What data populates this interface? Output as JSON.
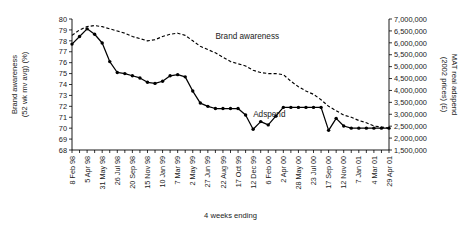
{
  "chart_data": {
    "type": "line",
    "title": "",
    "xlabel": "4 weeks ending",
    "ylabel": "Brand awareness (52 wk mv avg) (%)",
    "ylabel_line1": "Brand awareness",
    "ylabel_line2": "(52 wk mv avg) (%)",
    "y2label": "MAT real adspend (2002 prices) (£)",
    "y2label_line1": "MAT real adspend",
    "y2label_line2": "(2002 prices) (£)",
    "grid": false,
    "legend_position": "inline-annotations",
    "ylim": [
      68,
      80
    ],
    "yticks": [
      68,
      69,
      70,
      71,
      72,
      73,
      74,
      75,
      76,
      77,
      78,
      79,
      80
    ],
    "ytick_labels": [
      "68",
      "69",
      "70",
      "71",
      "72",
      "73",
      "74",
      "75",
      "76",
      "77",
      "78",
      "79",
      "80"
    ],
    "y2lim": [
      1500000,
      7000000
    ],
    "y2ticks": [
      1500000,
      2000000,
      2500000,
      3000000,
      3500000,
      4000000,
      4500000,
      5000000,
      5500000,
      6000000,
      6500000,
      7000000
    ],
    "y2tick_labels": [
      "1,500,000",
      "2,000,000",
      "2,500,000",
      "3,000,000",
      "3,500,000",
      "4,000,000",
      "4,500,000",
      "5,000,000",
      "5,500,000",
      "6,000,000",
      "6,500,000",
      "7,000,000"
    ],
    "categories": [
      "8 Feb 98",
      "8 Mar 98",
      "5 Apr 98",
      "3 May 98",
      "31 May 98",
      "28 Jun 98",
      "26 Jul 98",
      "23 Aug 98",
      "20 Sep 98",
      "18 Oct 98",
      "15 Nov 98",
      "13 Dec 98",
      "10 Jan 99",
      "7 Feb 99",
      "7 Mar 99",
      "4 Apr 99",
      "2 May 99",
      "30 May 99",
      "27 Jun 99",
      "25 Jul 99",
      "22 Aug 99",
      "19 Sep 99",
      "17 Oct 99",
      "14 Nov 99",
      "12 Dec 99",
      "9 Jan 00",
      "6 Feb 00",
      "5 Mar 00",
      "2 Apr 00",
      "30 Apr 00",
      "28 May 00",
      "25 Jun 00",
      "23 Jul 00",
      "20 Aug 00",
      "17 Sep 00",
      "15 Oct 00",
      "12 Nov 00",
      "10 Dec 00",
      "7 Jan 01",
      "4 Feb 01",
      "4 Mar 01",
      "1 Apr 01",
      "29 Apr 01"
    ],
    "xtick_labels": [
      "8 Feb 98",
      "5 Apr 98",
      "31 May 98",
      "26 Jul 98",
      "20 Sep 98",
      "15 Nov 98",
      "10 Jan 99",
      "7 Mar 99",
      "2 May 99",
      "27 Jun 99",
      "22 Aug 99",
      "17 Oct 99",
      "12 Dec 99",
      "6 Feb 00",
      "2 Apr 00",
      "28 May 00",
      "23 Jul 00",
      "17 Sep 00",
      "12 Nov 00",
      "7 Jan 01",
      "4 Mar 01",
      "29 Apr 01"
    ],
    "xtick_indices": [
      0,
      2,
      4,
      6,
      8,
      10,
      12,
      14,
      16,
      18,
      20,
      22,
      24,
      26,
      28,
      30,
      32,
      34,
      36,
      38,
      40,
      42
    ],
    "series": [
      {
        "name": "Brand awareness",
        "axis": "left",
        "style": "dashed",
        "markers": false,
        "label_x_index": 19,
        "label_y_value": 78.2,
        "values": [
          78.5,
          79.0,
          79.3,
          79.4,
          79.3,
          79.1,
          78.9,
          78.7,
          78.4,
          78.2,
          78.0,
          78.1,
          78.4,
          78.6,
          78.7,
          78.5,
          78.0,
          77.5,
          77.2,
          76.9,
          76.5,
          76.1,
          75.9,
          75.7,
          75.3,
          75.1,
          75.0,
          75.0,
          74.9,
          74.3,
          73.8,
          73.4,
          73.1,
          72.6,
          72.0,
          71.6,
          71.2,
          71.0,
          70.7,
          70.5,
          70.2,
          70.1,
          70.0
        ]
      },
      {
        "name": "Adspend",
        "axis": "left",
        "style": "solid",
        "markers": true,
        "label_x_index": 24,
        "label_y_value": 71.0,
        "values": [
          77.7,
          78.4,
          79.1,
          78.6,
          77.8,
          76.1,
          75.1,
          75.0,
          74.8,
          74.6,
          74.2,
          74.1,
          74.3,
          74.8,
          74.9,
          74.7,
          73.4,
          72.3,
          72.0,
          71.8,
          71.8,
          71.8,
          71.8,
          71.2,
          69.9,
          70.6,
          70.3,
          71.1,
          71.9,
          71.9,
          71.9,
          71.9,
          71.9,
          71.9,
          69.8,
          70.9,
          70.2,
          70.0,
          70.0,
          70.0,
          70.0,
          70.0,
          70.0
        ]
      }
    ]
  }
}
